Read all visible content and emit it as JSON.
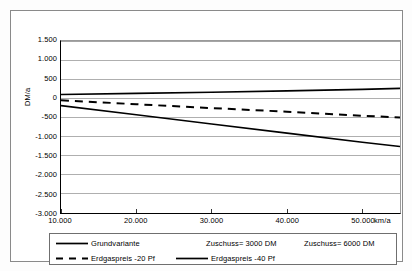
{
  "chart_data": {
    "type": "line",
    "title": "",
    "subtitle": "",
    "xlabel": "km/a",
    "ylabel": "DM/a",
    "xlim": [
      10000,
      55000
    ],
    "ylim": [
      -3000,
      1500
    ],
    "grid": true,
    "legend_position": "bottom",
    "x_ticks": [
      "10.000",
      "20.000",
      "30.000",
      "40.000",
      "50.000"
    ],
    "x_tick_values": [
      10000,
      20000,
      30000,
      40000,
      50000
    ],
    "y_ticks": [
      "1.500",
      "1.000",
      "500",
      "0",
      "-500",
      "-1.000",
      "-1.500",
      "-2.000",
      "-2.500",
      "-3.000"
    ],
    "y_tick_values": [
      1500,
      1000,
      500,
      0,
      -500,
      -1000,
      -1500,
      -2000,
      -2500,
      -3000
    ],
    "x": [
      10000,
      20000,
      30000,
      40000,
      50000,
      55000
    ],
    "series": [
      {
        "name": "Grundvariante",
        "style": "solid",
        "color": "#000000",
        "width": 1.6,
        "values": [
          100,
          130,
          160,
          195,
          235,
          260
        ]
      },
      {
        "name": "Erdgaspreis -20 Pf",
        "style": "dashed",
        "color": "#000000",
        "width": 2.0,
        "values": [
          -50,
          -155,
          -255,
          -350,
          -455,
          -500
        ]
      },
      {
        "name": "Erdgaspreis -40 Pf",
        "style": "solid",
        "color": "#000000",
        "width": 1.6,
        "values": [
          -190,
          -430,
          -670,
          -910,
          -1150,
          -1260
        ]
      }
    ],
    "legend_entries": [
      {
        "label": "Grundvariante",
        "style": "solid",
        "has_swatch": true
      },
      {
        "label": "Zuschuss= 3000 DM",
        "style": "none",
        "has_swatch": false
      },
      {
        "label": "Zuschuss= 6000 DM",
        "style": "none",
        "has_swatch": false
      },
      {
        "label": "Erdgaspreis -20 Pf",
        "style": "dashed",
        "has_swatch": true
      },
      {
        "label": "Erdgaspreis -40 Pf",
        "style": "solid",
        "has_swatch": true
      }
    ]
  },
  "axis": {
    "y_title": "DM/a",
    "x_unit": "km/a"
  },
  "colors": {
    "line": "#000000",
    "grid": "#9a9a9a",
    "frame": "#8a8a8a",
    "legend_border": "#6f6f6f",
    "background": "#ffffff"
  }
}
